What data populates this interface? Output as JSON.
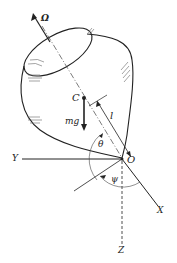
{
  "diagram": {
    "type": "spinning-top-gyroscope",
    "labels": {
      "omega": "Ω",
      "center_of_mass": "C",
      "gravity": "mg",
      "length": "l",
      "theta": "θ",
      "psi": "ψ",
      "origin": "O",
      "x_axis": "X",
      "y_axis": "Y",
      "z_axis": "Z"
    },
    "colors": {
      "line": "#222222",
      "hatch": "#555555",
      "background": "#ffffff"
    }
  }
}
